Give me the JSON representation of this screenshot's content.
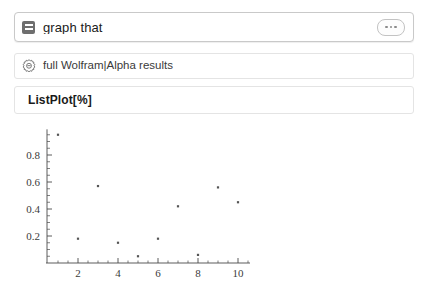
{
  "query": {
    "icon": "list-square-icon",
    "text": "graph that",
    "more_icon": "ellipsis-icon"
  },
  "results": {
    "full_results": {
      "icon": "gear-icon",
      "label": "full Wolfram|Alpha results"
    },
    "input_interpretation": {
      "label": "ListPlot[%]"
    }
  },
  "colors": {
    "page_background": "#ffffff",
    "query_border": "#c9c9c9",
    "row_border": "#e4e4e4",
    "text_primary": "#1b1b1b",
    "text_secondary": "#3a3a3a",
    "point_color": "#555555",
    "axis_color": "#4a4a4a"
  },
  "chart_data": {
    "type": "scatter",
    "title": "",
    "xlabel": "",
    "ylabel": "",
    "x": [
      1,
      2,
      3,
      4,
      5,
      6,
      7,
      8,
      9,
      10
    ],
    "values": [
      0.95,
      0.18,
      0.57,
      0.15,
      0.05,
      0.18,
      0.42,
      0.06,
      0.56,
      0.45
    ],
    "xlim": [
      0.4,
      10.6
    ],
    "ylim": [
      0.0,
      1.0
    ],
    "xticks_major": [
      2,
      4,
      6,
      8,
      10
    ],
    "xticks_major_labels": [
      "2",
      "4",
      "6",
      "8",
      "10"
    ],
    "yticks_major": [
      0.2,
      0.4,
      0.6,
      0.8
    ],
    "yticks_major_labels": [
      "0.2",
      "0.4",
      "0.6",
      "0.8"
    ],
    "xticks_minor_step": 0.5,
    "yticks_minor_step": 0.05,
    "grid": false,
    "legend": null,
    "marker": "square-dot",
    "marker_size": 2.2
  }
}
